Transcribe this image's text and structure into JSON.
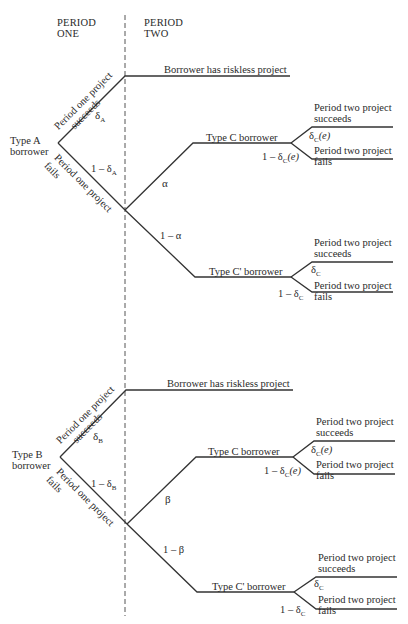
{
  "headers": {
    "period_one": [
      "PERIOD",
      "ONE"
    ],
    "period_two": [
      "PERIOD",
      "TWO"
    ]
  },
  "trees": [
    {
      "root": [
        "Type A",
        "borrower"
      ],
      "succeed_branch": {
        "label": [
          "Period one project",
          "succeeds"
        ],
        "prob": "δ",
        "prob_sub": "A",
        "outcome": "Borrower has riskless project"
      },
      "fail_branch": {
        "label": [
          "Period one project",
          "fails"
        ],
        "prob": "1 – δ",
        "prob_sub": "A"
      },
      "type_c": {
        "prob": "α",
        "label": "Type C borrower",
        "succeed": [
          "Period two project",
          "succeeds"
        ],
        "succeed_prob": "δ",
        "succeed_prob_sub": "C",
        "succeed_prob_suffix": "(e)",
        "fail": [
          "Period two project",
          "fails"
        ],
        "fail_prob": "1 – δ",
        "fail_prob_sub": "C",
        "fail_prob_suffix": "(e)"
      },
      "type_c_prime": {
        "prob": "1 – α",
        "label": "Type C' borrower",
        "succeed": [
          "Period two project",
          "succeeds"
        ],
        "succeed_prob": "δ",
        "succeed_prob_sub": "C",
        "succeed_prob_suffix": "",
        "fail": [
          "Period two project",
          "fails"
        ],
        "fail_prob": "1 – δ",
        "fail_prob_sub": "C",
        "fail_prob_suffix": ""
      }
    },
    {
      "root": [
        "Type B",
        "borrower"
      ],
      "succeed_branch": {
        "label": [
          "Period one project",
          "succeeds"
        ],
        "prob": "δ",
        "prob_sub": "B",
        "outcome": "Borrower has riskless project"
      },
      "fail_branch": {
        "label": [
          "Period one project",
          "fails"
        ],
        "prob": "1 – δ",
        "prob_sub": "B"
      },
      "type_c": {
        "prob": "β",
        "label": "Type C borrower",
        "succeed": [
          "Period two project",
          "succeeds"
        ],
        "succeed_prob": "δ",
        "succeed_prob_sub": "C",
        "succeed_prob_suffix": "(e)",
        "fail": [
          "Period two project",
          "fails"
        ],
        "fail_prob": "1 – δ",
        "fail_prob_sub": "C",
        "fail_prob_suffix": "(e)"
      },
      "type_c_prime": {
        "prob": "1 – β",
        "label": "Type C' borrower",
        "succeed": [
          "Period two project",
          "succeeds"
        ],
        "succeed_prob": "δ",
        "succeed_prob_sub": "C",
        "succeed_prob_suffix": "",
        "fail": [
          "Period two project",
          "fails"
        ],
        "fail_prob": "1 – δ",
        "fail_prob_sub": "C",
        "fail_prob_suffix": ""
      }
    }
  ]
}
